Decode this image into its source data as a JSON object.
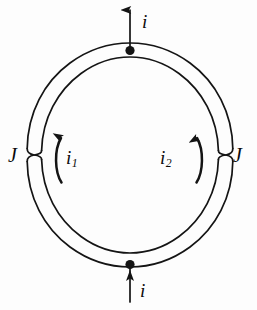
{
  "figure": {
    "background_color": "#fdfdfd",
    "stroke_color": "#141414",
    "labels": {
      "current_top": "i",
      "current_bottom": "i",
      "junction_left": "J",
      "junction_right": "J",
      "branch_current_left_base": "i",
      "branch_current_left_sub": "1",
      "branch_current_right_base": "i",
      "branch_current_right_sub": "2"
    },
    "icons": {
      "arrow_top": "arrow-up-icon",
      "arrow_bottom": "arrow-up-icon",
      "arrow_branch_left": "curved-arrow-up-icon",
      "arrow_branch_right": "curved-arrow-up-icon",
      "node_top": "contact-dot-icon",
      "node_bottom": "contact-dot-icon",
      "junction_left": "josephson-junction-icon",
      "junction_right": "josephson-junction-icon"
    },
    "geometry": {
      "center_x": 130,
      "center_y": 155,
      "outer_radius": 104,
      "inner_radius": 89,
      "junction_left_angle_deg": 180,
      "junction_right_angle_deg": 0,
      "lead_top_x": 130,
      "lead_top_y_start": 8,
      "lead_top_y_end": 51,
      "lead_bottom_x": 130,
      "lead_bottom_y_start": 259,
      "lead_bottom_y_end": 302
    }
  }
}
